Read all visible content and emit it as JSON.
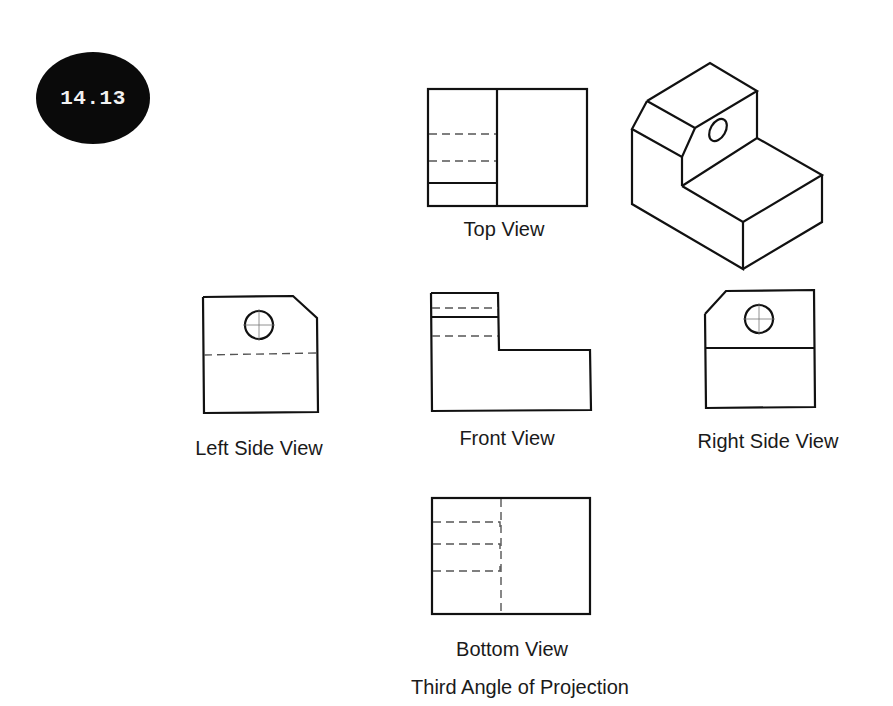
{
  "badge": {
    "text": "14.13"
  },
  "views": {
    "top": {
      "label": "Top View"
    },
    "left_side": {
      "label": "Left Side View"
    },
    "front": {
      "label": "Front View"
    },
    "right_side": {
      "label": "Right Side View"
    },
    "bottom": {
      "label": "Bottom View"
    },
    "isometric": {
      "label": ""
    }
  },
  "caption": "Third Angle of Projection",
  "colors": {
    "line": "#111111",
    "hidden_line": "#555555",
    "badge_bg": "#0a0a0a",
    "badge_text": "#f2f2f2"
  }
}
